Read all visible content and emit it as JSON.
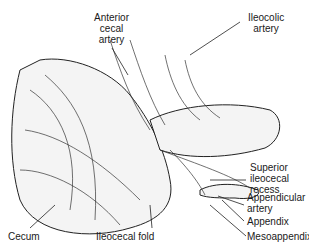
{
  "diagram": {
    "labels": [
      {
        "id": "anterior-cecal-artery",
        "text": "Anterior\ncecal\nartery"
      },
      {
        "id": "ileocolic-artery",
        "text": "Ileocolic\nartery"
      },
      {
        "id": "superior-ileocecal-recess",
        "text": "Superior\nileocecal\nrecess"
      },
      {
        "id": "appendicular-artery",
        "text": "Appendicular\nartery"
      },
      {
        "id": "appendix",
        "text": "Appendix"
      },
      {
        "id": "mesoappendix",
        "text": "Mesoappendix"
      },
      {
        "id": "cecum",
        "text": "Cecum"
      },
      {
        "id": "ileocecal-fold",
        "text": "Ileocecal fold"
      }
    ]
  }
}
